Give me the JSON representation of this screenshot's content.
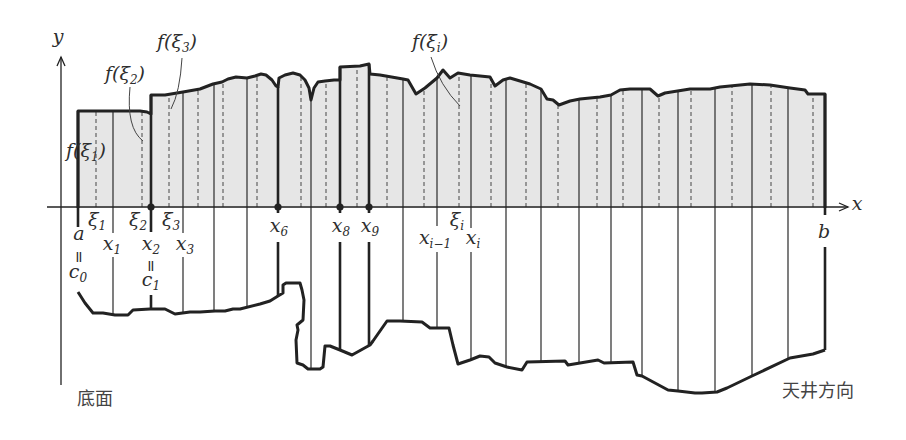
{
  "labels": {
    "y_axis": "y",
    "x_axis": "x",
    "f_xi1": {
      "pre": "f(ξ",
      "sub": "1",
      "post": ")"
    },
    "f_xi2": {
      "pre": "f(ξ",
      "sub": "2",
      "post": ")"
    },
    "f_xi3": {
      "pre": "f(ξ",
      "sub": "3",
      "post": ")"
    },
    "f_xii": {
      "pre": "f(ξ",
      "sub": "i",
      "post": ")"
    },
    "xi1": {
      "main": "ξ",
      "sub": "1"
    },
    "xi2": {
      "main": "ξ",
      "sub": "2"
    },
    "xi3": {
      "main": "ξ",
      "sub": "3"
    },
    "xii": {
      "main": "ξ",
      "sub": "i"
    },
    "a": "a",
    "b": "b",
    "equals": "=",
    "c0": {
      "main": "c",
      "sub": "0"
    },
    "c1": {
      "main": "c",
      "sub": "1"
    },
    "x1": {
      "main": "x",
      "sub": "1"
    },
    "x2": {
      "main": "x",
      "sub": "2"
    },
    "x3": {
      "main": "x",
      "sub": "3"
    },
    "x6": {
      "main": "x",
      "sub": "6"
    },
    "x8": {
      "main": "x",
      "sub": "8"
    },
    "x9": {
      "main": "x",
      "sub": "9"
    },
    "x_im1": {
      "main": "x",
      "sub": "i−1"
    },
    "x_i": {
      "main": "x",
      "sub": "i"
    }
  },
  "captions": {
    "bottom_left": "底面",
    "bottom_right": "天井方向"
  },
  "colors": {
    "stroke": "#222222",
    "fill": "#e6e6e6",
    "thin": "#3a3a3a"
  },
  "geometry": {
    "axis_y": 207,
    "x_axis": [
      47,
      848
    ],
    "y_axis_x": 61,
    "y_axis": [
      385,
      57
    ],
    "top_curve": [
      [
        78,
        208
      ],
      [
        78,
        111
      ],
      [
        140,
        111
      ],
      [
        147,
        112
      ],
      [
        151,
        114
      ],
      [
        151,
        95
      ],
      [
        165,
        95
      ],
      [
        183,
        92
      ],
      [
        200,
        89
      ],
      [
        213,
        84
      ],
      [
        222,
        82
      ],
      [
        228,
        79
      ],
      [
        236,
        77
      ],
      [
        247,
        78
      ],
      [
        255,
        76
      ],
      [
        261,
        74
      ],
      [
        266,
        75
      ],
      [
        272,
        80
      ],
      [
        276,
        86
      ],
      [
        278,
        87
      ],
      [
        279,
        78
      ],
      [
        285,
        75
      ],
      [
        293,
        73
      ],
      [
        300,
        75
      ],
      [
        305,
        80
      ],
      [
        309,
        88
      ],
      [
        311,
        100
      ],
      [
        314,
        88
      ],
      [
        318,
        82
      ],
      [
        325,
        81
      ],
      [
        334,
        80
      ],
      [
        340,
        80
      ],
      [
        340,
        67
      ],
      [
        360,
        66
      ],
      [
        369,
        64
      ],
      [
        370,
        74
      ],
      [
        380,
        75
      ],
      [
        403,
        79
      ],
      [
        408,
        80
      ],
      [
        416,
        94
      ],
      [
        425,
        88
      ],
      [
        437,
        78
      ],
      [
        443,
        70
      ],
      [
        450,
        78
      ],
      [
        458,
        73
      ],
      [
        470,
        75
      ],
      [
        490,
        77
      ],
      [
        495,
        86
      ],
      [
        503,
        80
      ],
      [
        510,
        78
      ],
      [
        530,
        84
      ],
      [
        541,
        89
      ],
      [
        547,
        99
      ],
      [
        553,
        100
      ],
      [
        559,
        105
      ],
      [
        570,
        101
      ],
      [
        580,
        99
      ],
      [
        600,
        97
      ],
      [
        611,
        95
      ],
      [
        620,
        90
      ],
      [
        630,
        89
      ],
      [
        650,
        89
      ],
      [
        658,
        96
      ],
      [
        665,
        93
      ],
      [
        690,
        89
      ],
      [
        710,
        89
      ],
      [
        720,
        87
      ],
      [
        740,
        85
      ],
      [
        750,
        84
      ],
      [
        770,
        85
      ],
      [
        790,
        88
      ],
      [
        805,
        90
      ],
      [
        808,
        94
      ],
      [
        825,
        94
      ],
      [
        825,
        208
      ]
    ],
    "bottom_curve": [
      [
        78,
        292
      ],
      [
        85,
        303
      ],
      [
        93,
        313
      ],
      [
        103,
        313
      ],
      [
        115,
        315
      ],
      [
        128,
        315
      ],
      [
        133,
        310
      ],
      [
        150,
        309
      ],
      [
        165,
        309
      ],
      [
        175,
        314
      ],
      [
        190,
        312
      ],
      [
        200,
        312
      ],
      [
        215,
        311
      ],
      [
        225,
        311
      ],
      [
        233,
        309
      ],
      [
        240,
        309
      ],
      [
        260,
        304
      ],
      [
        270,
        301
      ],
      [
        278,
        296
      ],
      [
        283,
        293
      ],
      [
        283,
        285
      ],
      [
        286,
        283
      ],
      [
        300,
        283
      ],
      [
        302,
        290
      ],
      [
        304,
        300
      ],
      [
        303,
        320
      ],
      [
        297,
        325
      ],
      [
        298,
        330
      ],
      [
        296,
        340
      ],
      [
        297,
        363
      ],
      [
        303,
        365
      ],
      [
        308,
        369
      ],
      [
        320,
        369
      ],
      [
        323,
        367
      ],
      [
        325,
        346
      ],
      [
        330,
        346
      ],
      [
        340,
        350
      ],
      [
        352,
        355
      ],
      [
        370,
        345
      ],
      [
        373,
        341
      ],
      [
        387,
        321
      ],
      [
        400,
        321
      ],
      [
        422,
        322
      ],
      [
        430,
        328
      ],
      [
        449,
        328
      ],
      [
        453,
        345
      ],
      [
        458,
        364
      ],
      [
        470,
        360
      ],
      [
        480,
        356
      ],
      [
        489,
        357
      ],
      [
        495,
        363
      ],
      [
        507,
        367
      ],
      [
        522,
        370
      ],
      [
        527,
        362
      ],
      [
        565,
        361
      ],
      [
        568,
        365
      ],
      [
        580,
        363
      ],
      [
        598,
        360
      ],
      [
        604,
        363
      ],
      [
        633,
        362
      ],
      [
        637,
        375
      ],
      [
        642,
        376
      ],
      [
        668,
        390
      ],
      [
        678,
        391
      ],
      [
        695,
        393
      ],
      [
        702,
        393
      ],
      [
        717,
        392
      ],
      [
        727,
        388
      ],
      [
        752,
        376
      ],
      [
        790,
        358
      ],
      [
        813,
        354
      ],
      [
        825,
        350
      ]
    ],
    "partitions": [
      {
        "x": 78,
        "thick": true,
        "stop": 227
      },
      {
        "x": 113,
        "thick": false,
        "gap": [
          233,
          257
        ]
      },
      {
        "x": 151,
        "thick": true,
        "gap": [
          232,
          295
        ]
      },
      {
        "x": 183,
        "thick": false,
        "gap": [
          233,
          257
        ]
      },
      {
        "x": 214,
        "thick": false
      },
      {
        "x": 247,
        "thick": false
      },
      {
        "x": 278,
        "thick": true,
        "gap": [
          213,
          242
        ]
      },
      {
        "x": 311,
        "thick": false
      },
      {
        "x": 340,
        "thick": true,
        "gap": [
          213,
          242
        ]
      },
      {
        "x": 369,
        "thick": true,
        "gap": [
          213,
          242
        ]
      },
      {
        "x": 403,
        "thick": false
      },
      {
        "x": 437,
        "thick": false,
        "gap": [
          226,
          252
        ]
      },
      {
        "x": 471,
        "thick": false,
        "gap": [
          228,
          252
        ]
      },
      {
        "x": 506,
        "thick": false
      },
      {
        "x": 541,
        "thick": false
      },
      {
        "x": 579,
        "thick": false
      },
      {
        "x": 611,
        "thick": false
      },
      {
        "x": 642,
        "thick": false
      },
      {
        "x": 678,
        "thick": false
      },
      {
        "x": 715,
        "thick": false
      },
      {
        "x": 752,
        "thick": false
      },
      {
        "x": 788,
        "thick": false
      },
      {
        "x": 825,
        "thick": true,
        "gap": [
          215,
          247
        ]
      }
    ],
    "samples": [
      96,
      142,
      169,
      198,
      223,
      257,
      301,
      326,
      357,
      387,
      424,
      459,
      491,
      526,
      558,
      597,
      623,
      659,
      691,
      732,
      771,
      813
    ],
    "dots": [
      151,
      278,
      340,
      369
    ],
    "leaders": [
      {
        "name": "leader-f-xi2",
        "d": "M130,87 Q126,128 143,141"
      },
      {
        "name": "leader-f-xi3",
        "d": "M182,58 Q180,92 171,109"
      },
      {
        "name": "leader-f-xii",
        "d": "M431,57 Q440,86 460,106"
      }
    ]
  }
}
